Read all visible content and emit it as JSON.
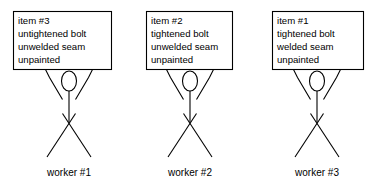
{
  "diagram": {
    "background_color": "#ffffff",
    "line_color": "#000000",
    "text_color": "#000000",
    "units": [
      {
        "id": "unit-1",
        "caption": "worker #1",
        "card": {
          "lines": [
            "item #3",
            "untightened bolt",
            "unwelded seam",
            "unpainted"
          ]
        }
      },
      {
        "id": "unit-2",
        "caption": "worker #2",
        "card": {
          "lines": [
            "item #2",
            "tightened bolt",
            "unwelded seam",
            "unpainted"
          ]
        }
      },
      {
        "id": "unit-3",
        "caption": "worker #3",
        "card": {
          "lines": [
            "item #1",
            "tightened bolt",
            "welded seam",
            "unpainted"
          ]
        }
      }
    ]
  }
}
